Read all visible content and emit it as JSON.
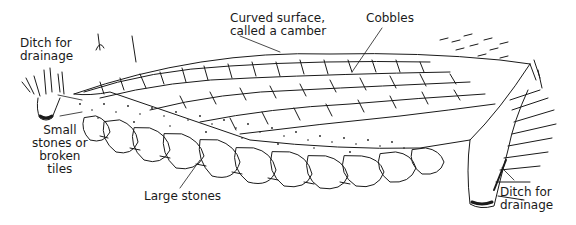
{
  "diagram": {
    "labels": [
      {
        "id": "ditch_left",
        "text": "Ditch for\ndrainage"
      },
      {
        "id": "camber",
        "text": "Curved surface,\ncalled a camber"
      },
      {
        "id": "cobbles",
        "text": "Cobbles"
      },
      {
        "id": "small_stones",
        "text": "Small\nstones or\nbroken\ntiles"
      },
      {
        "id": "large_stones",
        "text": "Large stones"
      },
      {
        "id": "ditch_right",
        "text": "Ditch for\ndrainage"
      }
    ],
    "colors": {
      "ink": "#1a1a1a",
      "background": "#ffffff"
    }
  }
}
